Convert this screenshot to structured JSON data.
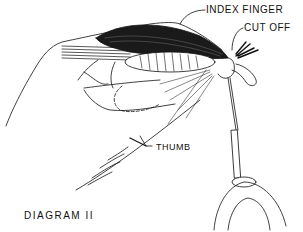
{
  "figure": {
    "title": "DIAGRAM II",
    "labels": {
      "index_finger": "INDEX FINGER",
      "cut_off": "CUT OFF",
      "thumb": "THUMB"
    },
    "colors": {
      "line": "#111111",
      "background": "#ffffff"
    }
  }
}
